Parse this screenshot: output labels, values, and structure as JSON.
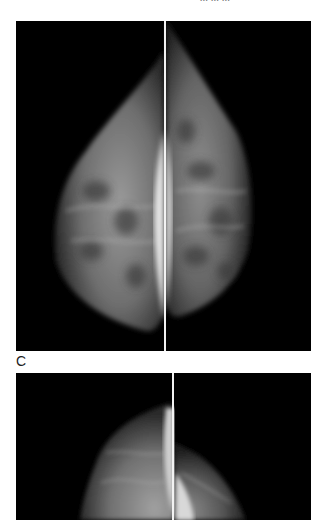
{
  "figure": {
    "header_fragment": "... ... ...",
    "panel_label": "C",
    "panels": [
      {
        "name": "top-pair",
        "description": "Mammogram pair, left and right views, with bright implant region near divider"
      },
      {
        "name": "bottom-pair",
        "description": "Mammogram pair, partially visible"
      }
    ],
    "colors": {
      "background": "#ffffff",
      "panel_bg": "#000000",
      "divider": "#f2f2f2",
      "tissue_light": "#bdbdbd",
      "tissue_dark": "#4a4a4a"
    }
  }
}
